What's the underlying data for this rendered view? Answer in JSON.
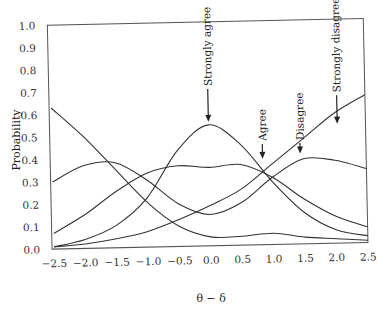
{
  "chart_data": {
    "type": "line",
    "title": "",
    "xlabel": "θ − δ",
    "ylabel": "Probability",
    "xlim": [
      -2.5,
      2.5
    ],
    "ylim": [
      0.0,
      1.0
    ],
    "grid": false,
    "legend": "none (curves labelled with arrow annotations)",
    "x_ticks": [
      "-2.5",
      "-2.0",
      "-1.5",
      "-1.0",
      "-0.5",
      "0.0",
      "0.5",
      "1.0",
      "1.5",
      "2.0",
      "2.5"
    ],
    "y_ticks": [
      "0.0",
      "0.1",
      "0.2",
      "0.3",
      "0.4",
      "0.5",
      "0.6",
      "0.7",
      "0.8",
      "0.9",
      "1.0"
    ],
    "x": [
      -2.5,
      -2.0,
      -1.5,
      -1.0,
      -0.5,
      0.0,
      0.5,
      1.0,
      1.5,
      2.0,
      2.5
    ],
    "series": [
      {
        "name": "Curve A (declining from left)",
        "values": [
          0.63,
          0.5,
          0.35,
          0.2,
          0.09,
          0.04,
          0.04,
          0.05,
          0.03,
          0.02,
          0.01
        ]
      },
      {
        "name": "Curve B (left peak)",
        "values": [
          0.3,
          0.37,
          0.38,
          0.3,
          0.19,
          0.14,
          0.19,
          0.3,
          0.38,
          0.37,
          0.33
        ]
      },
      {
        "name": "Agree",
        "values": [
          0.07,
          0.15,
          0.25,
          0.33,
          0.36,
          0.35,
          0.36,
          0.3,
          0.2,
          0.12,
          0.07
        ]
      },
      {
        "name": "Strongly agree",
        "values": [
          0.01,
          0.04,
          0.1,
          0.22,
          0.43,
          0.54,
          0.45,
          0.28,
          0.14,
          0.06,
          0.03
        ]
      },
      {
        "name": "Disagree",
        "values": [
          0.3,
          0.37,
          0.38,
          0.3,
          0.19,
          0.14,
          0.19,
          0.3,
          0.38,
          0.4,
          0.33
        ]
      },
      {
        "name": "Strongly disagree",
        "values": [
          0.01,
          0.02,
          0.04,
          0.07,
          0.12,
          0.18,
          0.25,
          0.36,
          0.47,
          0.58,
          0.66
        ]
      }
    ],
    "annotations": [
      {
        "text": "Strongly agree",
        "x": 0.0,
        "arrow_to_y": 0.54
      },
      {
        "text": "Agree",
        "x": 0.85,
        "arrow_to_y": 0.37
      },
      {
        "text": "Disagree",
        "x": 1.45,
        "arrow_to_y": 0.39
      },
      {
        "text": "Strongly disagree",
        "x": 2.05,
        "arrow_to_y": 0.52
      }
    ]
  },
  "labels": {
    "ylabel": "Probability",
    "xlabel": "θ − δ",
    "annot_strongly_agree": "Strongly agree",
    "annot_agree": "Agree",
    "annot_disagree": "Disagree",
    "annot_strongly_disagree": "Strongly disagree"
  }
}
